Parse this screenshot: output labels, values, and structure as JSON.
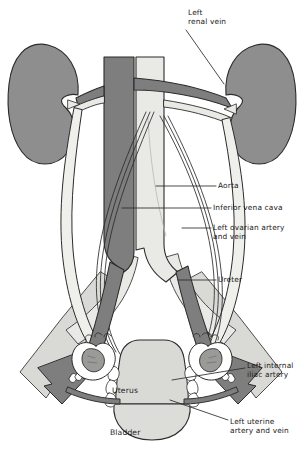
{
  "figure": {
    "view": "anterior",
    "background": "#ffffff"
  },
  "palette": {
    "outline": "#2b2b2b",
    "vein_dark": "#7e7e7e",
    "artery_light": "#e9e9e6",
    "organ_gray": "#8e8e8e",
    "organ_pale": "#d9d9d6",
    "ureter_fill": "#efefec",
    "ovary_fill": "#9a9a99",
    "white": "#ffffff",
    "label_text": "#1b1b1b",
    "leader_line": "#2b2b2b"
  },
  "labels": {
    "left_renal_vein": {
      "lines": [
        "Left",
        "renal vein"
      ],
      "x": 188,
      "y": 8
    },
    "aorta": {
      "lines": [
        "Aorta"
      ],
      "x": 218,
      "y": 181
    },
    "inferior_vena_cava": {
      "lines": [
        "Inferior vena cava"
      ],
      "x": 213,
      "y": 203
    },
    "left_ovarian_artery_vein": {
      "lines": [
        "Left ovarian artery",
        "and vein"
      ],
      "x": 213,
      "y": 223
    },
    "ureter": {
      "lines": [
        "Ureter"
      ],
      "x": 218,
      "y": 275
    },
    "left_internal_iliac_artery": {
      "lines": [
        "Left internal",
        "iliac artery"
      ],
      "x": 247,
      "y": 361
    },
    "left_uterine_artery_vein": {
      "lines": [
        "Left uterine",
        "artery and vein"
      ],
      "x": 230,
      "y": 417
    },
    "uterus": {
      "lines": [
        "Uterus"
      ],
      "x": 112,
      "y": 386
    },
    "bladder": {
      "lines": [
        "Bladder"
      ],
      "x": 110,
      "y": 428
    }
  },
  "structures": [
    {
      "name": "right-kidney",
      "side": "viewer-left",
      "fill": "organ_gray"
    },
    {
      "name": "left-kidney",
      "side": "viewer-right",
      "fill": "organ_gray"
    },
    {
      "name": "inferior-vena-cava",
      "fill": "vein_dark"
    },
    {
      "name": "aorta",
      "fill": "artery_light"
    },
    {
      "name": "left-renal-vein",
      "fill": "vein_dark"
    },
    {
      "name": "right-renal-vein",
      "fill": "vein_dark"
    },
    {
      "name": "renal-arteries",
      "fill": "artery_light"
    },
    {
      "name": "ureter-left",
      "fill": "ureter_fill"
    },
    {
      "name": "ureter-right",
      "fill": "ureter_fill"
    },
    {
      "name": "ovarian-artery-left",
      "fill": "white"
    },
    {
      "name": "ovarian-vein-left",
      "fill": "white"
    },
    {
      "name": "ovarian-artery-right",
      "fill": "white"
    },
    {
      "name": "ovarian-vein-right",
      "fill": "white"
    },
    {
      "name": "common-iliac-artery-left",
      "fill": "artery_light"
    },
    {
      "name": "common-iliac-artery-right",
      "fill": "artery_light"
    },
    {
      "name": "common-iliac-vein-left",
      "fill": "vein_dark"
    },
    {
      "name": "common-iliac-vein-right",
      "fill": "vein_dark"
    },
    {
      "name": "external-iliac-artery-left",
      "fill": "vein_dark"
    },
    {
      "name": "external-iliac-artery-right",
      "fill": "vein_dark"
    },
    {
      "name": "internal-iliac-artery-left",
      "fill": "organ_pale"
    },
    {
      "name": "internal-iliac-artery-right",
      "fill": "organ_pale"
    },
    {
      "name": "uterus-body",
      "fill": "organ_pale"
    },
    {
      "name": "bladder-dome",
      "fill": "organ_pale"
    },
    {
      "name": "ovary-left",
      "fill": "ovary_fill"
    },
    {
      "name": "ovary-right",
      "fill": "ovary_fill"
    },
    {
      "name": "fallopian-tube-left",
      "fill": "white"
    },
    {
      "name": "fallopian-tube-right",
      "fill": "white"
    },
    {
      "name": "uterine-artery-left",
      "fill": "vein_dark"
    },
    {
      "name": "uterine-artery-right",
      "fill": "vein_dark"
    },
    {
      "name": "broad-ligament-vessels",
      "fill": "white"
    }
  ]
}
